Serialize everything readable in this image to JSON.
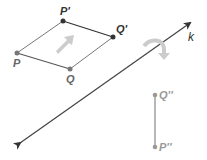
{
  "diagram": {
    "type": "geometry-transformation",
    "colors": {
      "line": "#444444",
      "segment": "#777777",
      "point_dark": "#333333",
      "point_light": "#888888",
      "arrow_fill": "#cccccc"
    },
    "points": {
      "P": {
        "label": "P",
        "x": 17,
        "y": 53
      },
      "Q": {
        "label": "Q",
        "x": 70,
        "y": 69
      },
      "P_prime": {
        "label": "P'",
        "x": 63,
        "y": 21
      },
      "Q_prime": {
        "label": "Q'",
        "x": 113,
        "y": 37
      },
      "Q_double_prime": {
        "label": "Q''",
        "x": 155,
        "y": 95
      },
      "P_double_prime": {
        "label": "P''",
        "x": 155,
        "y": 147
      }
    },
    "line_k": {
      "label": "k",
      "x1": 16,
      "y1": 146,
      "x2": 192,
      "y2": 22
    },
    "translation_arrow": {
      "icon": "translation-arrow-icon"
    },
    "reflection_arrow": {
      "icon": "curved-reflection-arrow-icon"
    }
  }
}
